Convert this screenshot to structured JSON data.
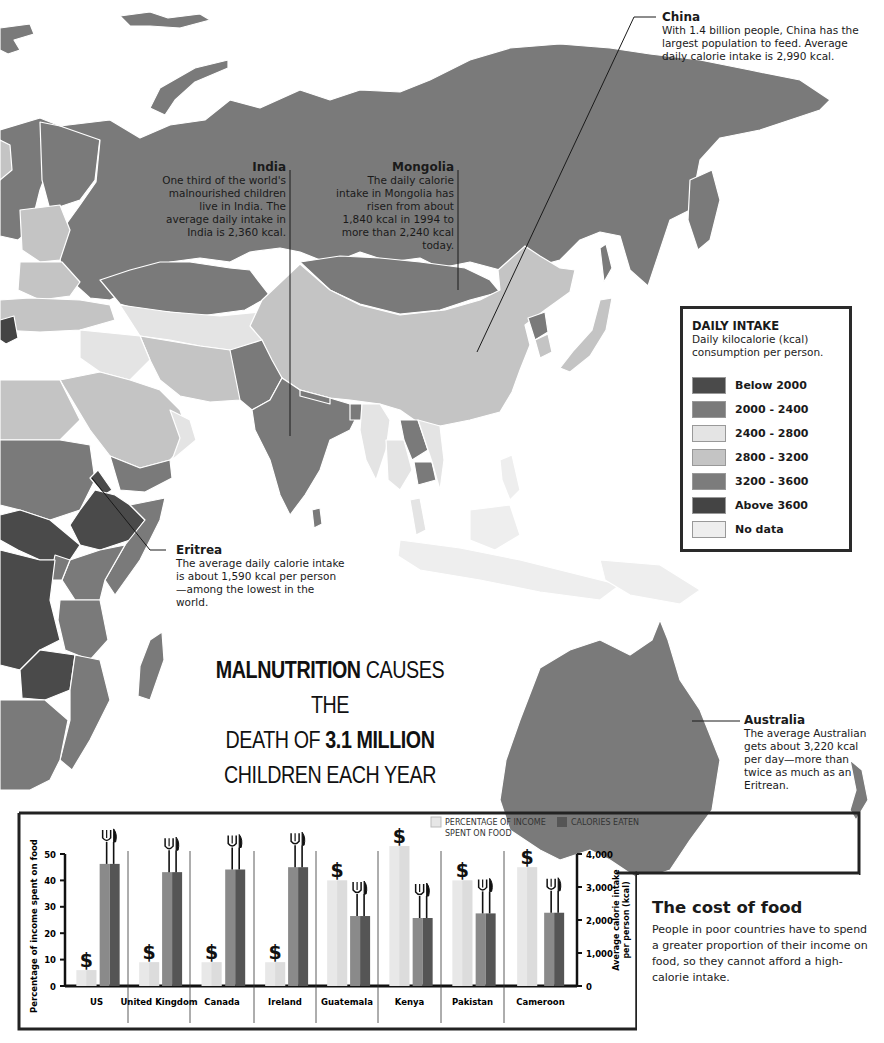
{
  "map": {
    "title": "Daily calorie intake world map (Asia, East Africa, Australia)",
    "colors": {
      "below_2000": "#4a4a4a",
      "r2000_2400": "#7a7a7a",
      "r2400_2800": "#e4e4e4",
      "r2800_3200": "#c4c4c4",
      "r3200_3600": "#7c7c7c",
      "above_3600": "#444444",
      "no_data": "#eeeeee",
      "ocean": "#ffffff",
      "border": "#ffffff"
    }
  },
  "callouts": {
    "china": {
      "title": "China",
      "text": "With 1.4 billion people, China has the largest population to feed. Average daily calorie intake is 2,990 kcal."
    },
    "india": {
      "title": "India",
      "text": "One third of the world's malnourished children live in India. The average daily intake in India is 2,360 kcal."
    },
    "mongolia": {
      "title": "Mongolia",
      "text": "The daily calorie intake in Mongolia has risen from about 1,840 kcal in 1994 to more than 2,240 kcal today."
    },
    "eritrea": {
      "title": "Eritrea",
      "text": "The average daily calorie intake is about 1,590 kcal per person—among the lowest in the world."
    },
    "australia": {
      "title": "Australia",
      "text": "The average Australian gets about 3,220 kcal per day—more than twice as much as an Eritrean."
    }
  },
  "legend": {
    "title": "DAILY INTAKE",
    "subtitle": "Daily kilocalorie (kcal) consumption per person.",
    "items": [
      {
        "label": "Below 2000",
        "color": "#4a4a4a"
      },
      {
        "label": "2000 - 2400",
        "color": "#7a7a7a"
      },
      {
        "label": "2400 - 2800",
        "color": "#e4e4e4"
      },
      {
        "label": "2800 - 3200",
        "color": "#c4c4c4"
      },
      {
        "label": "3200 - 3600",
        "color": "#7c7c7c"
      },
      {
        "label": "Above 3600",
        "color": "#444444"
      },
      {
        "label": "No data",
        "color": "#eeeeee"
      }
    ]
  },
  "headline": {
    "bold1": "MALNUTRITION",
    "text1": " CAUSES THE",
    "text2": "DEATH OF ",
    "bold2": "3.1 MILLION",
    "text3": "CHILDREN EACH YEAR"
  },
  "cost_of_food": {
    "title": "The cost of food",
    "text": "People in poor countries have to spend a greater proportion of their income on food, so they cannot afford a high-calorie intake."
  },
  "chart_data": {
    "type": "bar",
    "title": "The cost of food",
    "categories": [
      "US",
      "United Kingdom",
      "Canada",
      "Ireland",
      "Guatemala",
      "Kenya",
      "Pakistan",
      "Cameroon"
    ],
    "series": [
      {
        "name": "PERCENTAGE OF INCOME SPENT ON FOOD",
        "axis": "left",
        "color": "#e6e6e6",
        "values": [
          6,
          9,
          9,
          9,
          40,
          53,
          40,
          45
        ]
      },
      {
        "name": "CALORIES EATEN",
        "axis": "right",
        "color": "#7a7a7a",
        "values": [
          3700,
          3450,
          3530,
          3600,
          2120,
          2060,
          2200,
          2220
        ]
      }
    ],
    "ylabel": "Percentage of income spent on food",
    "ylim": [
      0,
      50
    ],
    "yticks": [
      "0",
      "10",
      "20",
      "30",
      "40",
      "50"
    ],
    "y2label": "Average calorie intake per person (kcal)",
    "y2lim": [
      0,
      4000
    ],
    "y2ticks": [
      "0",
      "1,000",
      "2,000",
      "3,000",
      "4,000"
    ],
    "legend_position": "top-right",
    "grid": false,
    "markers": {
      "income_bar_icon": "$",
      "calorie_bar_icon": "fork-knife"
    }
  }
}
